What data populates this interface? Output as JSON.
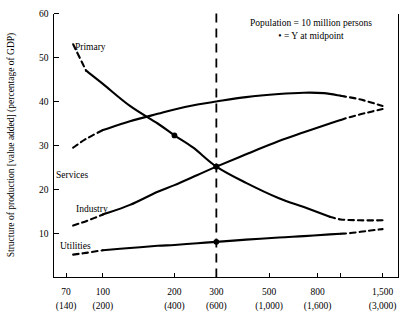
{
  "chart_data": {
    "type": "line",
    "title": "",
    "xlabel": "",
    "ylabel": "Structure of production [value added] (percentage of GDP)",
    "ylim": [
      0,
      60
    ],
    "yticks": [
      10,
      20,
      30,
      40,
      50,
      60
    ],
    "ytick_labels": [
      "10",
      "20",
      "30",
      "40",
      "50",
      "60"
    ],
    "xtick_labels_top": [
      "70",
      "100",
      "200",
      "300",
      "500",
      "800",
      "1,500"
    ],
    "xtick_labels_bottom": [
      "(140)",
      "(200)",
      "(400)",
      "(600)",
      "(1,000)",
      "(1,600)",
      "(3,000)"
    ],
    "xtick_values": [
      70,
      100,
      200,
      300,
      500,
      800,
      1500
    ],
    "x_scale": "log",
    "grid": false,
    "legend_position": "top-right",
    "annotations": [
      "Population = 10 million persons",
      "• = Y at midpoint"
    ],
    "reference_line": {
      "label": "midpoint",
      "x_value": 300,
      "style": "dashed-vertical"
    },
    "series": [
      {
        "name": "Primary",
        "label": "Primary",
        "x": [
          75,
          85,
          100,
          130,
          170,
          200,
          240,
          300,
          400,
          550,
          700,
          900,
          1000,
          1200,
          1500
        ],
        "values": [
          53,
          47,
          44,
          39,
          35,
          32.3,
          29.5,
          25.2,
          21.5,
          18,
          16,
          13.8,
          13.2,
          13,
          13
        ],
        "solid_x_range": [
          85,
          900
        ],
        "midpoint_marker": {
          "x": 200,
          "y": 32.3
        }
      },
      {
        "name": "Services",
        "label": "Services",
        "x": [
          75,
          85,
          100,
          130,
          170,
          200,
          250,
          300,
          400,
          550,
          700,
          850,
          1000,
          1200,
          1500
        ],
        "values": [
          29.5,
          31.5,
          33.5,
          35.5,
          37.2,
          38.2,
          39.3,
          40,
          41,
          41.7,
          42,
          41.9,
          41.3,
          40.5,
          39
        ],
        "solid_x_range": [
          100,
          1000
        ],
        "midpoint_marker": {
          "x": 300,
          "y": 25.2
        }
      },
      {
        "name": "Industry",
        "label": "Industry",
        "x": [
          75,
          85,
          100,
          130,
          170,
          200,
          250,
          300,
          400,
          550,
          700,
          900,
          1100,
          1300,
          1500
        ],
        "values": [
          11.8,
          12.8,
          14.3,
          16.5,
          19.5,
          21,
          23.3,
          25.2,
          28,
          31,
          33,
          35,
          36.5,
          37.5,
          38.3
        ],
        "solid_x_range": [
          100,
          1000
        ],
        "midpoint_marker": {
          "x": 300,
          "y": 25.2
        }
      },
      {
        "name": "Utilities",
        "label": "Utilities",
        "x": [
          75,
          85,
          100,
          130,
          170,
          200,
          250,
          300,
          400,
          550,
          700,
          900,
          1100,
          1300,
          1500
        ],
        "values": [
          5.2,
          5.6,
          6.2,
          6.7,
          7.2,
          7.4,
          7.8,
          8.1,
          8.6,
          9.1,
          9.4,
          9.8,
          10.1,
          10.6,
          11
        ],
        "solid_x_range": [
          100,
          1000
        ],
        "midpoint_marker": {
          "x": 300,
          "y": 8.1
        }
      }
    ]
  }
}
